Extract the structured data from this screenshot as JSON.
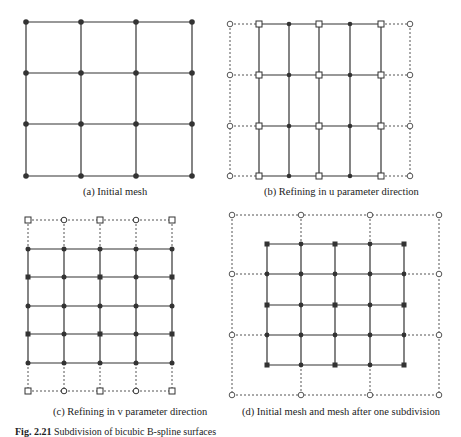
{
  "panels": [
    {
      "id": "a",
      "caption": "(a) Initial mesh"
    },
    {
      "id": "b",
      "caption": "(b) Refining in u parameter direction"
    },
    {
      "id": "c",
      "caption": "(c) Refining in v parameter direction"
    },
    {
      "id": "d",
      "caption": "(d) Initial mesh and mesh after one subdivision"
    }
  ],
  "figure": {
    "label": "Fig. 2.21",
    "caption": "Subdivision of bicubic B-spline surfaces"
  },
  "legend_markers": {
    "solid_dot": "new control point",
    "square": "retained/refined point",
    "circle": "original control point"
  },
  "colors": {
    "line": "#333333",
    "dashed": "#555555",
    "background": "#ffffff"
  }
}
